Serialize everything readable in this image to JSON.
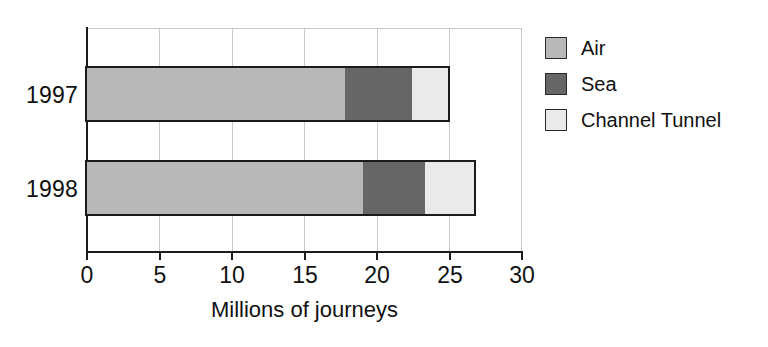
{
  "chart_data": {
    "type": "bar",
    "orientation": "horizontal",
    "stacked": true,
    "title": "",
    "xlabel": "Millions of journeys",
    "ylabel": "",
    "categories": [
      "1997",
      "1998"
    ],
    "series": [
      {
        "name": "Air",
        "values": [
          17.8,
          19.0
        ],
        "color": "#b8b8b8"
      },
      {
        "name": "Sea",
        "values": [
          4.6,
          4.3
        ],
        "color": "#666666"
      },
      {
        "name": "Channel Tunnel",
        "values": [
          2.5,
          3.4
        ],
        "color": "#eaeaea"
      }
    ],
    "cumulative_totals": [
      24.9,
      26.7
    ],
    "xlim": [
      0,
      30
    ],
    "xticks": [
      0,
      5,
      10,
      15,
      20,
      25,
      30
    ],
    "xtick_labels": [
      "0",
      "5",
      "10",
      "15",
      "20",
      "25",
      "30"
    ],
    "grid": "vertical",
    "legend_position": "right"
  },
  "axis": {
    "x_title": "Millions of journeys",
    "tick_labels": [
      "0",
      "5",
      "10",
      "15",
      "20",
      "25",
      "30"
    ],
    "category_labels": [
      "1997",
      "1998"
    ]
  },
  "legend": {
    "items": [
      {
        "label": "Air",
        "color": "#b8b8b8"
      },
      {
        "label": "Sea",
        "color": "#666666"
      },
      {
        "label": "Channel Tunnel",
        "color": "#eaeaea"
      }
    ]
  },
  "colors": {
    "air": "#b8b8b8",
    "sea": "#666666",
    "channel_tunnel": "#eaeaea",
    "axis": "#1b1b1b",
    "grid": "#c9c9c9",
    "background": "#ffffff"
  }
}
